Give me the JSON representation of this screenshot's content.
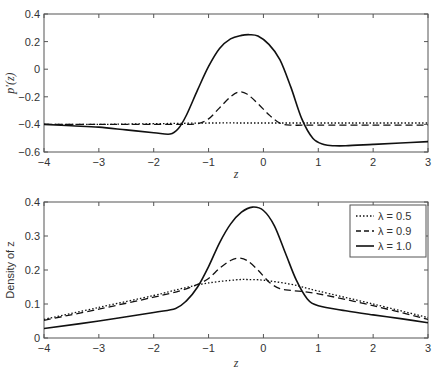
{
  "chart_data": [
    {
      "type": "line",
      "title": "",
      "xlabel": "z",
      "ylabel": "p'(z)",
      "xlim": [
        -4,
        3
      ],
      "ylim": [
        -0.6,
        0.4
      ],
      "xticks": [
        "-4",
        "-3",
        "-2",
        "-1",
        "0",
        "1",
        "2",
        "3"
      ],
      "yticks": [
        "-0.6",
        "-0.4",
        "-0.2",
        "0",
        "0.2",
        "0.4"
      ],
      "grid": false,
      "series": [
        {
          "name": "λ = 0.5",
          "style": "dotted",
          "x": [
            -4,
            -3,
            -2,
            -1,
            0,
            1,
            2,
            3
          ],
          "y": [
            -0.4,
            -0.4,
            -0.395,
            -0.39,
            -0.39,
            -0.39,
            -0.39,
            -0.39
          ]
        },
        {
          "name": "λ = 0.9",
          "style": "dashed",
          "x": [
            -4,
            -3,
            -2,
            -1.5,
            -1.2,
            -1.0,
            -0.8,
            -0.6,
            -0.45,
            -0.3,
            -0.1,
            0.1,
            0.3,
            0.5,
            1,
            2,
            3
          ],
          "y": [
            -0.4,
            -0.4,
            -0.4,
            -0.4,
            -0.395,
            -0.36,
            -0.28,
            -0.2,
            -0.165,
            -0.18,
            -0.25,
            -0.33,
            -0.39,
            -0.405,
            -0.405,
            -0.405,
            -0.405
          ]
        },
        {
          "name": "λ = 1.0",
          "style": "solid",
          "x": [
            -4,
            -3.5,
            -3,
            -2.5,
            -2,
            -1.7,
            -1.55,
            -1.4,
            -1.2,
            -1.0,
            -0.8,
            -0.6,
            -0.4,
            -0.25,
            -0.1,
            0.1,
            0.3,
            0.5,
            0.7,
            0.9,
            1.1,
            1.3,
            1.5,
            2,
            2.5,
            3
          ],
          "y": [
            -0.4,
            -0.41,
            -0.42,
            -0.44,
            -0.46,
            -0.47,
            -0.43,
            -0.33,
            -0.15,
            0.02,
            0.15,
            0.22,
            0.245,
            0.25,
            0.24,
            0.18,
            0.07,
            -0.13,
            -0.36,
            -0.5,
            -0.545,
            -0.555,
            -0.555,
            -0.545,
            -0.535,
            -0.525
          ]
        }
      ]
    },
    {
      "type": "line",
      "title": "",
      "xlabel": "z",
      "ylabel": "Density of z",
      "xlim": [
        -4,
        3
      ],
      "ylim": [
        0,
        0.4
      ],
      "xticks": [
        "-4",
        "-3",
        "-2",
        "-1",
        "0",
        "1",
        "2",
        "3"
      ],
      "yticks": [
        "0",
        "0.1",
        "0.2",
        "0.3",
        "0.4"
      ],
      "grid": false,
      "legend": {
        "position": "upper right",
        "entries": [
          {
            "label": "λ = 0.5",
            "style": "dotted"
          },
          {
            "label": "λ = 0.9",
            "style": "dashed"
          },
          {
            "label": "λ = 1.0",
            "style": "solid"
          }
        ]
      },
      "series": [
        {
          "name": "λ = 0.5",
          "style": "dotted",
          "x": [
            -4,
            -3,
            -2,
            -1.5,
            -1,
            -0.5,
            -0.3,
            0,
            0.5,
            1,
            2,
            3
          ],
          "y": [
            0.055,
            0.09,
            0.125,
            0.145,
            0.162,
            0.171,
            0.172,
            0.17,
            0.158,
            0.138,
            0.1,
            0.06
          ]
        },
        {
          "name": "λ = 0.9",
          "style": "dashed",
          "x": [
            -4,
            -3,
            -2,
            -1.5,
            -1.2,
            -1.0,
            -0.8,
            -0.6,
            -0.45,
            -0.3,
            -0.1,
            0.1,
            0.3,
            0.5,
            1,
            2,
            3
          ],
          "y": [
            0.052,
            0.085,
            0.12,
            0.14,
            0.158,
            0.175,
            0.205,
            0.228,
            0.235,
            0.228,
            0.2,
            0.165,
            0.145,
            0.14,
            0.13,
            0.095,
            0.055
          ]
        },
        {
          "name": "λ = 1.0",
          "style": "solid",
          "x": [
            -4,
            -3,
            -2,
            -1.6,
            -1.4,
            -1.2,
            -1.0,
            -0.8,
            -0.6,
            -0.4,
            -0.2,
            0,
            0.2,
            0.4,
            0.6,
            0.8,
            1.0,
            1.5,
            2,
            2.5,
            3
          ],
          "y": [
            0.028,
            0.05,
            0.075,
            0.087,
            0.11,
            0.15,
            0.21,
            0.28,
            0.335,
            0.37,
            0.385,
            0.375,
            0.33,
            0.25,
            0.17,
            0.115,
            0.095,
            0.08,
            0.068,
            0.057,
            0.045
          ]
        }
      ]
    }
  ]
}
